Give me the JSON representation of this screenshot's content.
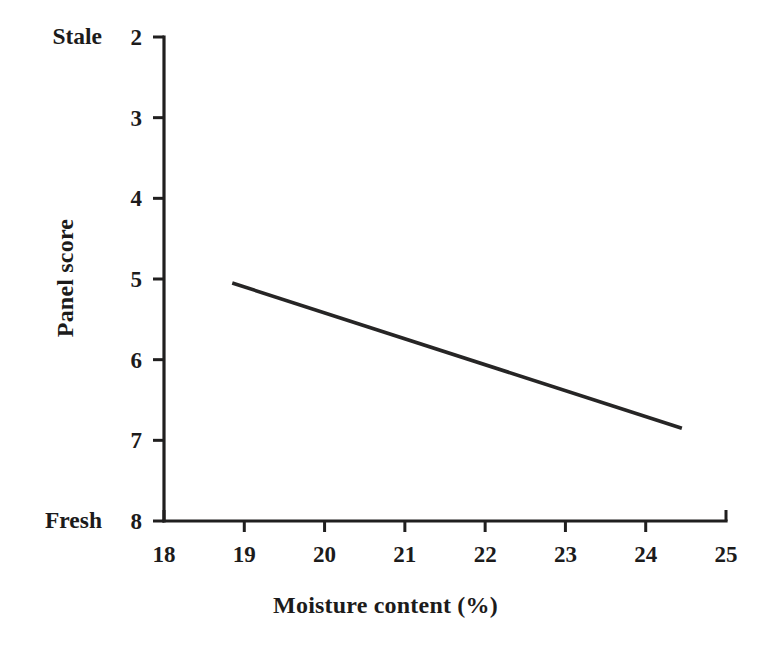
{
  "chart_data": {
    "type": "line",
    "title": "",
    "xlabel": "Moisture content (%)",
    "ylabel": "Panel score",
    "xlim": [
      18,
      25
    ],
    "ylim": [
      2,
      8
    ],
    "y_inverted": true,
    "grid": false,
    "legend": null,
    "x_ticks": [
      18,
      19,
      20,
      21,
      22,
      23,
      24,
      25
    ],
    "x_tick_labels": [
      "18",
      "19",
      "20",
      "21",
      "22",
      "23",
      "24",
      "25"
    ],
    "y_ticks": [
      2,
      3,
      4,
      5,
      6,
      7,
      8
    ],
    "y_tick_labels": [
      "2",
      "3",
      "4",
      "5",
      "6",
      "7",
      "8"
    ],
    "annotations": [
      {
        "text": "Stale",
        "at_y": 2,
        "position": "left-of-axis-top"
      },
      {
        "text": "Fresh",
        "at_y": 8,
        "position": "left-of-axis-bottom"
      }
    ],
    "series": [
      {
        "name": "Panel score vs moisture content",
        "color": "#262525",
        "x": [
          18.85,
          24.45
        ],
        "values": [
          5.05,
          6.85
        ]
      }
    ]
  },
  "axis": {
    "x_title": "Moisture content (%)",
    "y_title": "Panel score",
    "top_anchor_label": "Stale",
    "bottom_anchor_label": "Fresh"
  },
  "colors": {
    "line": "#262525",
    "axis": "#201f1f",
    "text": "#1c1b1b",
    "background": "#ffffff"
  }
}
